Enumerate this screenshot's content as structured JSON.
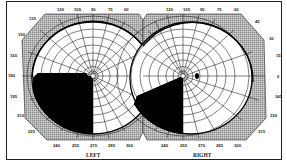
{
  "figure": {
    "type": "visual-field-perimetry-chart",
    "eyes": [
      {
        "id": "left",
        "label": "LEFT",
        "center": [
          93,
          76
        ],
        "top_labels": [
          "120",
          "105",
          "90",
          "75",
          "60"
        ],
        "side_labels": [
          "135",
          "150",
          "165",
          "180",
          "195",
          "210",
          "225"
        ],
        "bottom_labels": [
          "240",
          "255",
          "270",
          "285",
          "300"
        ],
        "defect": {
          "description": "dense inferior temporal (lower-left) quadrant loss",
          "from_deg": 180,
          "to_deg": 270
        }
      },
      {
        "id": "right",
        "label": "RIGHT",
        "center": [
          183,
          76
        ],
        "top_labels": [
          "120",
          "105",
          "90",
          "75",
          "60"
        ],
        "side_labels": [
          "45",
          "30",
          "15",
          "0",
          "345",
          "330",
          "315"
        ],
        "bottom_labels": [
          "240",
          "255",
          "270",
          "285",
          "300"
        ],
        "defect": {
          "description": "inferior nasal wedge loss",
          "from_deg": 200,
          "to_deg": 270
        },
        "blind_spot": {
          "deg": 0,
          "eccentricity": 15
        }
      }
    ],
    "colors": {
      "grid": "#1a1a1a",
      "outer_band": "#a8a8a8",
      "defect": "#000000",
      "background": "#ffffff"
    }
  }
}
